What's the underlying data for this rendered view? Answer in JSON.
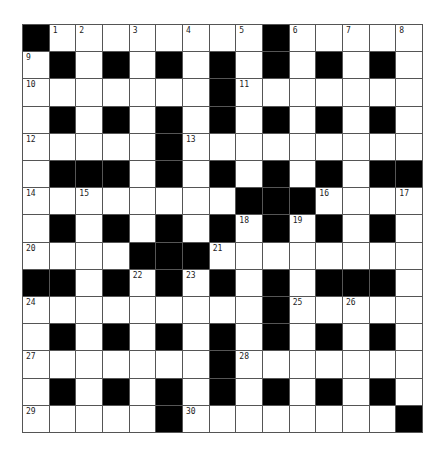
{
  "puzzle": {
    "rows": 15,
    "cols": 15,
    "colors": {
      "block": "#000000",
      "cell": "#ffffff",
      "line": "#555555"
    },
    "layout": [
      "#........#.....",
      ".#.#.#.#.#.#.#.",
      ".......#.......",
      ".#.#.#.#.#.#.#.",
      ".....#.........",
      ".###.#.#.#.#.##",
      "........###....",
      ".#.#.#.#.#.#.#.",
      "....###........",
      "##.#.#.#.#.###.",
      ".........#.....",
      ".#.#.#.#.#.#.#.",
      ".......#.......",
      ".#.#.#.#.#.#.#.",
      ".....#........#"
    ],
    "numbers": [
      {
        "r": 0,
        "c": 1,
        "n": "1"
      },
      {
        "r": 0,
        "c": 2,
        "n": "2"
      },
      {
        "r": 0,
        "c": 4,
        "n": "3"
      },
      {
        "r": 0,
        "c": 6,
        "n": "4"
      },
      {
        "r": 0,
        "c": 8,
        "n": "5"
      },
      {
        "r": 0,
        "c": 10,
        "n": "6"
      },
      {
        "r": 0,
        "c": 12,
        "n": "7"
      },
      {
        "r": 0,
        "c": 14,
        "n": "8"
      },
      {
        "r": 1,
        "c": 0,
        "n": "9"
      },
      {
        "r": 2,
        "c": 0,
        "n": "10"
      },
      {
        "r": 2,
        "c": 8,
        "n": "11"
      },
      {
        "r": 4,
        "c": 0,
        "n": "12"
      },
      {
        "r": 4,
        "c": 6,
        "n": "13"
      },
      {
        "r": 6,
        "c": 0,
        "n": "14"
      },
      {
        "r": 6,
        "c": 2,
        "n": "15"
      },
      {
        "r": 6,
        "c": 11,
        "n": "16"
      },
      {
        "r": 6,
        "c": 14,
        "n": "17"
      },
      {
        "r": 7,
        "c": 8,
        "n": "18"
      },
      {
        "r": 7,
        "c": 10,
        "n": "19"
      },
      {
        "r": 8,
        "c": 0,
        "n": "20"
      },
      {
        "r": 8,
        "c": 7,
        "n": "21"
      },
      {
        "r": 9,
        "c": 4,
        "n": "22"
      },
      {
        "r": 9,
        "c": 6,
        "n": "23"
      },
      {
        "r": 10,
        "c": 0,
        "n": "24"
      },
      {
        "r": 10,
        "c": 10,
        "n": "25"
      },
      {
        "r": 10,
        "c": 12,
        "n": "26"
      },
      {
        "r": 12,
        "c": 0,
        "n": "27"
      },
      {
        "r": 12,
        "c": 8,
        "n": "28"
      },
      {
        "r": 14,
        "c": 0,
        "n": "29"
      },
      {
        "r": 14,
        "c": 6,
        "n": "30"
      }
    ]
  }
}
